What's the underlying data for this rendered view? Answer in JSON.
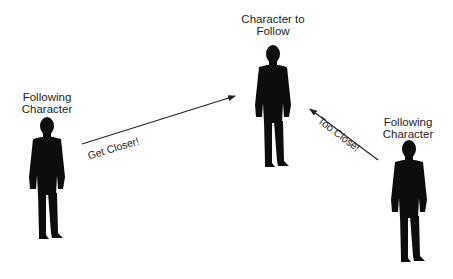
{
  "diagram": {
    "target": {
      "label_line1": "Character to",
      "label_line2": "Follow"
    },
    "follower_left": {
      "label_line1": "Following",
      "label_line2": "Character"
    },
    "follower_right": {
      "label_line1": "Following",
      "label_line2": "Character"
    },
    "arrows": [
      {
        "name": "get-closer",
        "label": "Get Closer!",
        "from": "follower_left",
        "to": "target"
      },
      {
        "name": "too-close",
        "label": "Too Close!",
        "from": "follower_right",
        "to": "target"
      }
    ],
    "colors": {
      "silhouette": "#0d0d0d",
      "line": "#222222",
      "background": "#ffffff"
    }
  }
}
